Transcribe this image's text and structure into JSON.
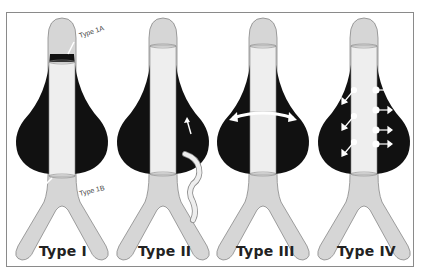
{
  "figure": {
    "panels": [
      {
        "id": "type1",
        "label": "Type I",
        "annotations": [
          "Type 1A",
          "Type 1B"
        ]
      },
      {
        "id": "type2",
        "label": "Type II",
        "annotations": []
      },
      {
        "id": "type3",
        "label": "Type III",
        "annotations": []
      },
      {
        "id": "type4",
        "label": "Type IV",
        "annotations": []
      }
    ]
  },
  "colors": {
    "aneurysm_sac": "#111111",
    "vessel": "#d6d6d6",
    "stent_graft": "#eeeeee",
    "outline": "#888888",
    "arrow": "#ffffff",
    "frame_border": "#8a8a8a",
    "label_text": "#222222"
  }
}
